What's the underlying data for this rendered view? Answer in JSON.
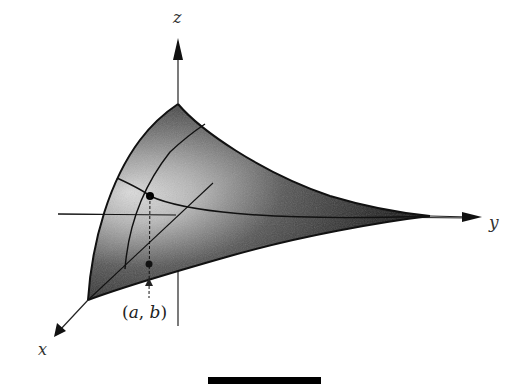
{
  "figure": {
    "type": "3d-surface-diagram",
    "axes": {
      "x": {
        "label": "x"
      },
      "y": {
        "label": "y"
      },
      "z": {
        "label": "z"
      }
    },
    "point_label": {
      "open": "(",
      "a": "a",
      "sep": ", ",
      "b": "b",
      "close": ")"
    },
    "colors": {
      "ink": "#111111",
      "surface_light": "#f2f2f2",
      "surface_dark": "#141414",
      "axis": "#222222"
    }
  }
}
